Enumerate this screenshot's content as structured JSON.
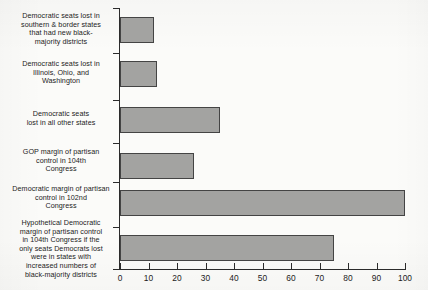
{
  "chart_data": {
    "type": "bar",
    "orientation": "horizontal",
    "title": "",
    "subtitle": "",
    "xlabel": "",
    "ylabel": "",
    "xlim": [
      0,
      100
    ],
    "xticks": [
      0,
      10,
      20,
      30,
      40,
      50,
      60,
      70,
      80,
      90,
      100
    ],
    "xtick_labels": [
      "0",
      "10",
      "20",
      "30",
      "40",
      "50",
      "60",
      "70",
      "80",
      "90",
      "100"
    ],
    "grid": false,
    "legend": false,
    "bar_fill_color": "#a3a3a1",
    "bar_edge_color": "#444444",
    "axis_color": "#2b2b2b",
    "background_color": "#fbfbf9",
    "categories": [
      "Democratic seats lost in\nsouthern & border states\nthat had new black-\nmajority districts",
      "Democratic seats lost in\nIllinois, Ohio, and\nWashington",
      "Democratic seats\nlost in all other states",
      "GOP margin of partisan\ncontrol in 104th\nCongress",
      "Democratic margin of partisan\ncontrol in 102nd\nCongress",
      "Hypothetical Democratic\nmargin of partisan control\nin 104th Congress if the\nonly seats Democrats lost\nwere in states with\nincreased numbers of\nblack-majority districts"
    ],
    "values": [
      12,
      13,
      35,
      26,
      100,
      75
    ]
  },
  "bars": [
    {
      "label": "Democratic seats lost in\nsouthern & border states\nthat had new black-\nmajority districts",
      "value": 12,
      "top": 17,
      "height": 26,
      "label_top": 12
    },
    {
      "label": "Democratic seats lost in\nIllinois, Ohio, and\nWashington",
      "value": 13,
      "top": 61,
      "height": 26,
      "label_top": 60
    },
    {
      "label": "Democratic seats\nlost in all other states",
      "value": 35,
      "top": 107,
      "height": 26,
      "label_top": 110
    },
    {
      "label": "GOP margin of partisan\ncontrol in 104th\nCongress",
      "value": 26,
      "top": 153,
      "height": 26,
      "label_top": 148
    },
    {
      "label": "Democratic margin of partisan\ncontrol in 102nd\nCongress",
      "value": 100,
      "top": 190,
      "height": 26,
      "label_top": 185
    },
    {
      "label": "Hypothetical Democratic\nmargin of partisan control\nin 104th Congress if the\nonly seats Democrats lost\nwere in states with\nincreased numbers of\nblack-majority districts",
      "value": 75,
      "top": 235,
      "height": 26,
      "label_top": 219
    }
  ],
  "y_tick_positions": [
    8,
    53,
    100,
    143,
    182,
    227,
    269
  ]
}
